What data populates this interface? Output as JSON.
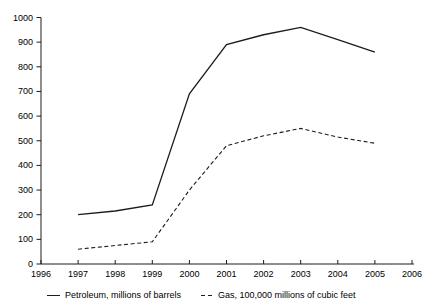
{
  "chart_data": {
    "type": "line",
    "title": "",
    "xlabel": "",
    "ylabel": "",
    "x": [
      1997,
      1998,
      1999,
      2000,
      2001,
      2002,
      2003,
      2004,
      2005
    ],
    "series": [
      {
        "name": "Petroleum, millions of barrels",
        "style": "solid",
        "values": [
          200,
          215,
          240,
          690,
          890,
          930,
          960,
          910,
          860
        ]
      },
      {
        "name": "Gas, 100,000 millions of cubic feet",
        "style": "dashed",
        "values": [
          60,
          75,
          90,
          300,
          480,
          520,
          550,
          515,
          490
        ]
      }
    ],
    "xlim": [
      1996,
      2006
    ],
    "ylim": [
      0,
      1000
    ],
    "x_ticks": [
      1996,
      1997,
      1998,
      1999,
      2000,
      2001,
      2002,
      2003,
      2004,
      2005,
      2006
    ],
    "y_ticks": [
      0,
      100,
      200,
      300,
      400,
      500,
      600,
      700,
      800,
      900,
      1000
    ],
    "grid": false,
    "legend_position": "bottom",
    "line_color": "#1c1c1c",
    "text_color": "#000000"
  }
}
